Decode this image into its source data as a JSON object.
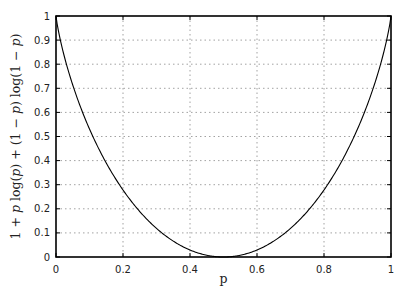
{
  "chart_data": {
    "type": "line",
    "title": "",
    "xlabel": "p",
    "ylabel": "1 + p log(p) + (1 − p) log(1 − p)",
    "xlim": [
      0,
      1
    ],
    "ylim": [
      0,
      1
    ],
    "grid": true,
    "grid_style": "dotted",
    "legend": null,
    "x_ticks": [
      "0",
      "0.2",
      "0.4",
      "0.6",
      "0.8",
      "1"
    ],
    "y_ticks": [
      "0",
      "0.1",
      "0.2",
      "0.3",
      "0.4",
      "0.5",
      "0.6",
      "0.7",
      "0.8",
      "0.9",
      "1"
    ],
    "series": [
      {
        "name": "1 + p log2(p) + (1-p) log2(1-p)",
        "color": "#000000",
        "x": [
          0,
          0.02,
          0.05,
          0.1,
          0.15,
          0.2,
          0.25,
          0.3,
          0.35,
          0.4,
          0.45,
          0.5,
          0.55,
          0.6,
          0.65,
          0.7,
          0.75,
          0.8,
          0.85,
          0.9,
          0.95,
          0.98,
          1
        ],
        "y": [
          1,
          0.859,
          0.714,
          0.531,
          0.39,
          0.278,
          0.189,
          0.119,
          0.066,
          0.029,
          0.007,
          0,
          0.007,
          0.029,
          0.066,
          0.119,
          0.189,
          0.278,
          0.39,
          0.531,
          0.714,
          0.859,
          1
        ]
      }
    ]
  },
  "labels": {
    "xlabel": "p",
    "ylabel_parts": [
      "1 + ",
      "p",
      " log(",
      "p",
      ") + (1 − ",
      "p",
      ") log(1 − ",
      "p",
      ")"
    ]
  }
}
